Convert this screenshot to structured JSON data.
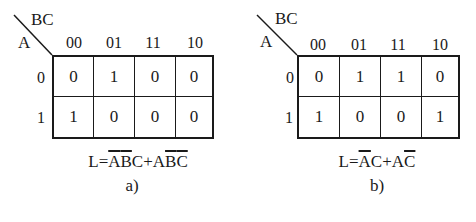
{
  "diagrams": [
    {
      "id": "a",
      "corner_labels": {
        "top": "BC",
        "left": "A"
      },
      "column_headers": [
        "00",
        "01",
        "11",
        "10"
      ],
      "row_headers": [
        "0",
        "1"
      ],
      "cells": [
        [
          "0",
          "1",
          "0",
          "0"
        ],
        [
          "1",
          "0",
          "0",
          "0"
        ]
      ],
      "formula": {
        "parts": [
          {
            "text": "L=",
            "overline": false
          },
          {
            "text": "A",
            "overline": true
          },
          {
            "text": "B",
            "overline": true
          },
          {
            "text": "C+A",
            "overline": false
          },
          {
            "text": "B",
            "overline": true
          },
          {
            "text": "C",
            "overline": true
          }
        ]
      },
      "caption": "a)"
    },
    {
      "id": "b",
      "corner_labels": {
        "top": "BC",
        "left": "A"
      },
      "column_headers": [
        "00",
        "01",
        "11",
        "10"
      ],
      "row_headers": [
        "0",
        "1"
      ],
      "cells": [
        [
          "0",
          "1",
          "1",
          "0"
        ],
        [
          "1",
          "0",
          "0",
          "1"
        ]
      ],
      "formula": {
        "parts": [
          {
            "text": "L=",
            "overline": false
          },
          {
            "text": "A",
            "overline": true
          },
          {
            "text": "C+A",
            "overline": false
          },
          {
            "text": "C",
            "overline": true
          }
        ]
      },
      "caption": "b)"
    }
  ]
}
